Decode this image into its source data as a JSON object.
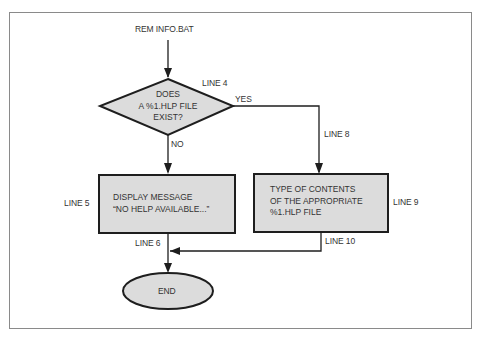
{
  "diagram": {
    "type": "flowchart",
    "title": "REM INFO.BAT",
    "colors": {
      "shape_fill": "#dcdcdc",
      "stroke": "#1e1e1e",
      "frame": "#8a8a8a",
      "text": "#333333"
    },
    "nodes": {
      "start": {
        "label": "REM INFO.BAT"
      },
      "decision": {
        "line1": "DOES",
        "line2": "A %1.HLP FILE",
        "line3": "EXIST?",
        "line_label": "LINE 4"
      },
      "no_box": {
        "line1": "DISPLAY MESSAGE",
        "line2": "“NO HELP AVAILABLE...”",
        "line_label": "LINE 5"
      },
      "yes_box": {
        "line1": "TYPE OF CONTENTS",
        "line2": "OF THE APPROPRIATE",
        "line3": "%1.HLP FILE",
        "line_label": "LINE 9"
      },
      "end": {
        "label": "END"
      }
    },
    "edges": {
      "yes_label": "YES",
      "no_label": "NO",
      "line8": "LINE 8",
      "line6": "LINE 6",
      "line10": "LINE 10"
    }
  }
}
